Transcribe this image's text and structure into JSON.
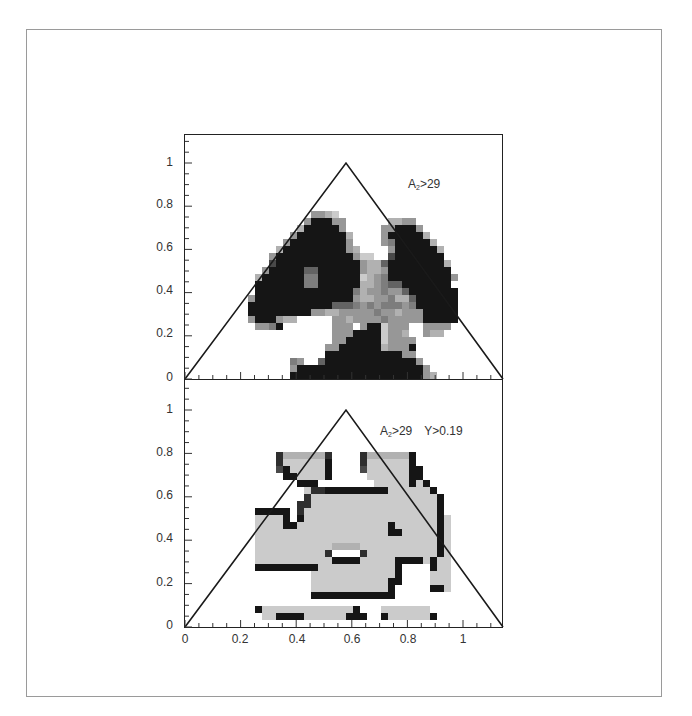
{
  "chart_data": [
    {
      "type": "heatmap",
      "title": "",
      "annotation": {
        "symbol": "A",
        "subscript": "2",
        "text": ">29"
      },
      "xlabel": "",
      "ylabel": "",
      "xlim": [
        0,
        1.155
      ],
      "ylim": [
        0,
        1.1
      ],
      "x_ticks": [],
      "y_ticks": [
        "0",
        "0.2",
        "0.4",
        "0.6",
        "0.8",
        "1"
      ],
      "overlay": {
        "shape": "triangle",
        "vertices": [
          [
            0,
            0
          ],
          [
            0.577,
            1
          ],
          [
            1.155,
            0
          ]
        ]
      },
      "colormap": "grayscale (white=low, black=high)",
      "grid_origin_px": [
        241,
        379
      ],
      "cell_px": 7,
      "rows_top_to_bottom": [
        "00000000004432000000000000000000",
        "00000000049994400000033440000000",
        "00000000399999400000449994000000",
        "00000004999999930000499999300000",
        "00000049999999940000459999930000",
        "00000399999999943000049999993000",
        "00004999999999994220079999999000",
        "00007999999999999433699999999300",
        "00049999966999999433499999999900",
        "00399999955999999234599999999940",
        "00999999955999999334566999999900",
        "00999999999999995344544699999990",
        "04999999999999994334453369999990",
        "09999999999996665454555459999990",
        "09999999994433444445443444999990",
        "04999433000004434444544444999990",
        "00445900000004440499244400444400",
        "00000000000004449999244300433000",
        "00000000000004499999244440000000",
        "00000000000044999999344490000000",
        "00000000000099999999999440000000",
        "00000005400699999999999994000000",
        "00000004999999999999999999400000",
        "00000009999999999999999999430000"
      ]
    },
    {
      "type": "heatmap",
      "title": "",
      "annotation": {
        "symbol": "A",
        "subscript": "2",
        "text": ">29",
        "extra": "Y>0.19"
      },
      "xlabel": "",
      "ylabel": "",
      "xlim": [
        0,
        1.155
      ],
      "ylim": [
        0,
        1.1
      ],
      "x_ticks": [
        "0",
        "0.2",
        "0.4",
        "0.6",
        "0.8",
        "1"
      ],
      "y_ticks": [
        "0",
        "0.2",
        "0.4",
        "0.6",
        "0.8",
        "1"
      ],
      "overlay": {
        "shape": "triangle",
        "vertices": [
          [
            0,
            0
          ],
          [
            0.577,
            1
          ],
          [
            1.155,
            0
          ]
        ]
      },
      "colormap": "grayscale (white=low, black=high)",
      "grid_origin_px": [
        241,
        627
      ],
      "cell_px": 7,
      "rows_top_to_bottom": [
        "00000833333380000833333390000000",
        "00000822222290000822222290000000",
        "00000792222290000722222299000000",
        "00000099222290000022222299000000",
        "00000000999000000002222292900000",
        "00000000028899999999922222290000",
        "00000000082222222222222222229000",
        "00000000882222222222222222229000",
        "00999990822222222222222222229000",
        "00222290922222222222222222229200",
        "00222299222222222222292222229200",
        "00222222222222222222299222229200",
        "00222222222222222222222222229200",
        "00222222222223333222222222229200",
        "00222222222280000822222222229200",
        "00222222222229999222229999292200",
        "00999999999222222222229000092200",
        "00000000002222222222229000022200",
        "00000000002222222222299000022200",
        "00000000002222222222290000099200",
        "00000000009999999999990000000000",
        "00000000000000000000000000000000",
        "00922222222222229000222222200000",
        "00022999922222299900922222290000",
        "00000000000000000000000000000000"
      ]
    }
  ],
  "plots": {
    "top": {
      "annotation": {
        "symbol": "A",
        "subscript": "2",
        "text": ">29"
      },
      "y_tick_labels": [
        "1",
        "0.8",
        "0.6",
        "0.4",
        "0.2",
        "0"
      ]
    },
    "bottom": {
      "annotation": {
        "symbol": "A",
        "subscript": "2",
        "text": ">29",
        "extra": "Y>0.19"
      },
      "y_tick_labels": [
        "1",
        "0.8",
        "0.6",
        "0.4",
        "0.2",
        "0"
      ],
      "x_tick_labels": [
        "0",
        "0.2",
        "0.4",
        "0.6",
        "0.8",
        "1"
      ]
    }
  }
}
